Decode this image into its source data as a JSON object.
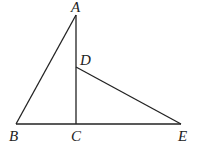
{
  "diagram": {
    "type": "geometry",
    "stroke_color": "#222222",
    "background": "#ffffff",
    "points": {
      "A": {
        "label": "A",
        "x": 76,
        "y": 15
      },
      "B": {
        "label": "B",
        "x": 16,
        "y": 124
      },
      "C": {
        "label": "C",
        "x": 76,
        "y": 124
      },
      "D": {
        "label": "D",
        "x": 76,
        "y": 67
      },
      "E": {
        "label": "E",
        "x": 181,
        "y": 124
      }
    },
    "segments": [
      {
        "from": "A",
        "to": "B"
      },
      {
        "from": "A",
        "to": "C"
      },
      {
        "from": "B",
        "to": "E"
      },
      {
        "from": "D",
        "to": "E"
      }
    ],
    "labels": {
      "A": "A",
      "B": "B",
      "C": "C",
      "D": "D",
      "E": "E"
    }
  }
}
